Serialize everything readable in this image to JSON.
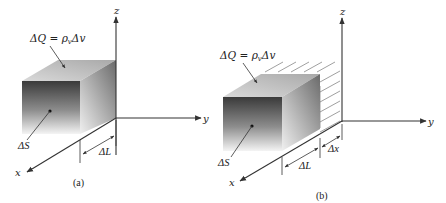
{
  "figure": {
    "panels": [
      {
        "id": "a",
        "caption": "(a)",
        "axes": {
          "x": "x",
          "y": "y",
          "z": "z"
        },
        "labels": {
          "charge": "ΔQ = ρ",
          "charge_sub": "v",
          "charge_tail": "Δv",
          "surface": "ΔS",
          "length": "ΔL"
        }
      },
      {
        "id": "b",
        "caption": "(b)",
        "axes": {
          "x": "x",
          "y": "y",
          "z": "z"
        },
        "labels": {
          "charge": "ΔQ = ρ",
          "charge_sub": "v",
          "charge_tail": "Δv",
          "surface": "ΔS",
          "length": "ΔL",
          "displacement": "Δx"
        }
      }
    ],
    "colors": {
      "line": "#333333",
      "front_face_top": "#3a3a3a",
      "front_face_bottom": "#f2f2f2",
      "top_face": "#c8c8c8",
      "side_face": "#8a8a8a",
      "hatch": "#777777"
    }
  }
}
